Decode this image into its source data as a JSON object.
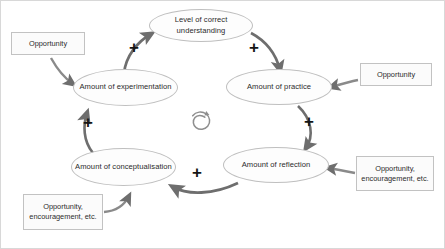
{
  "diagram": {
    "type": "causal-loop-diagram",
    "background_color": "#ffffff",
    "frame_border_color": "#d8d8d8",
    "node_fill_color": "#fdfdfd",
    "node_border_color": "#bfbfbf",
    "box_fill_color": "#fbfbfb",
    "box_border_color": "#c2c2c2",
    "arrow_color": "#6e6e6e",
    "text_color": "#2b2b2b",
    "plus_color": "#151515",
    "loop_direction": "clockwise"
  },
  "nodes": [
    {
      "id": "understanding",
      "label": "Level of correct understanding"
    },
    {
      "id": "practice",
      "label": "Amount of practice"
    },
    {
      "id": "reflection",
      "label": "Amount of reflection"
    },
    {
      "id": "conceptualisation",
      "label": "Amount of conceptualisation"
    },
    {
      "id": "experimentation",
      "label": "Amount of experimentation"
    }
  ],
  "external_inputs": [
    {
      "id": "input-experimentation",
      "label": "Opportunity",
      "target": "experimentation"
    },
    {
      "id": "input-practice",
      "label": "Opportunity",
      "target": "practice"
    },
    {
      "id": "input-reflection",
      "label": "Opportunity, encouragement, etc.",
      "target": "reflection"
    },
    {
      "id": "input-conceptualisation",
      "label": "Opportunity, encouragement, etc.",
      "target": "conceptualisation"
    }
  ],
  "links": [
    {
      "id": "link-experimentation-understanding",
      "from": "experimentation",
      "to": "understanding",
      "polarity": "+"
    },
    {
      "id": "link-understanding-practice",
      "from": "understanding",
      "to": "practice",
      "polarity": "+"
    },
    {
      "id": "link-practice-reflection",
      "from": "practice",
      "to": "reflection",
      "polarity": "+"
    },
    {
      "id": "link-reflection-conceptualisation",
      "from": "reflection",
      "to": "conceptualisation",
      "polarity": "+"
    },
    {
      "id": "link-conceptualisation-experimentation",
      "from": "conceptualisation",
      "to": "experimentation",
      "polarity": "+"
    }
  ],
  "center_symbol": {
    "id": "reinforcing-loop-spiral",
    "name": "spiral-arrow-icon",
    "meaning": "reinforcing loop"
  }
}
